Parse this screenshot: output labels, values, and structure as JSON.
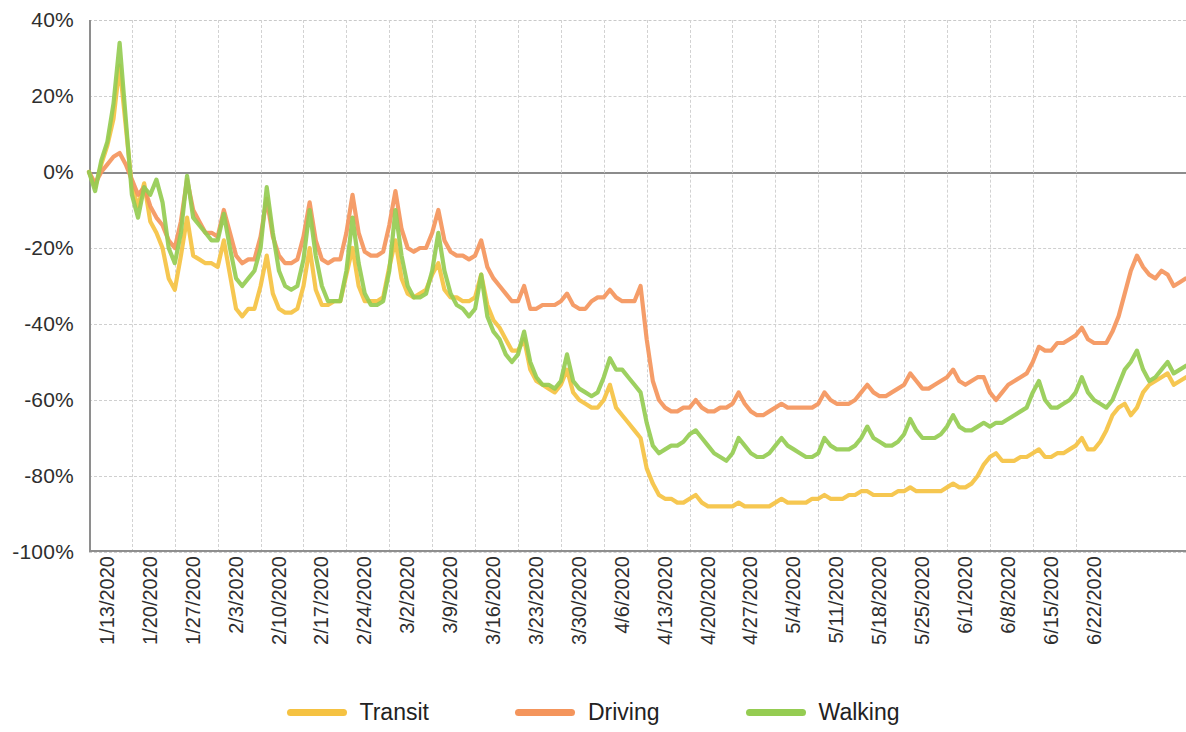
{
  "chart_data": {
    "type": "line",
    "title": "",
    "subtitle": "",
    "xlabel": "",
    "ylabel": "",
    "ylim": [
      -100,
      40
    ],
    "ytick_values": [
      40,
      20,
      0,
      -20,
      -40,
      -60,
      -80,
      -100
    ],
    "ytick_labels": [
      "40%",
      "20%",
      "0%",
      "-20%",
      "-40%",
      "-60%",
      "-80%",
      "-100%"
    ],
    "grid": true,
    "legend_position": "bottom",
    "x_start": "1/13/2020",
    "x_end": "6/25/2020",
    "xtick_labels": [
      "1/13/2020",
      "1/20/2020",
      "1/27/2020",
      "2/3/2020",
      "2/10/2020",
      "2/17/2020",
      "2/24/2020",
      "3/2/2020",
      "3/9/2020",
      "3/16/2020",
      "3/23/2020",
      "3/30/2020",
      "4/6/2020",
      "4/13/2020",
      "4/20/2020",
      "4/27/2020",
      "5/4/2020",
      "5/11/2020",
      "5/18/2020",
      "5/25/2020",
      "6/1/2020",
      "6/8/2020",
      "6/15/2020",
      "6/22/2020"
    ],
    "xtick_interval_days": 7,
    "series": [
      {
        "name": "Transit",
        "color": "#F5C242",
        "values": [
          0,
          -4,
          2,
          7,
          14,
          28,
          12,
          -4,
          -9,
          -3,
          -13,
          -16,
          -20,
          -28,
          -31,
          -22,
          -12,
          -22,
          -23,
          -24,
          -24,
          -25,
          -18,
          -27,
          -36,
          -38,
          -36,
          -36,
          -30,
          -22,
          -32,
          -36,
          -37,
          -37,
          -36,
          -30,
          -20,
          -31,
          -35,
          -35,
          -34,
          -34,
          -27,
          -20,
          -30,
          -34,
          -34,
          -34,
          -33,
          -25,
          -18,
          -28,
          -32,
          -33,
          -32,
          -31,
          -27,
          -24,
          -31,
          -33,
          -33,
          -34,
          -34,
          -33,
          -27,
          -35,
          -39,
          -41,
          -44,
          -47,
          -47,
          -44,
          -52,
          -55,
          -56,
          -57,
          -58,
          -56,
          -52,
          -58,
          -60,
          -61,
          -62,
          -62,
          -60,
          -56,
          -62,
          -64,
          -66,
          -68,
          -70,
          -78,
          -82,
          -85,
          -86,
          -86,
          -87,
          -87,
          -86,
          -85,
          -87,
          -88,
          -88,
          -88,
          -88,
          -88,
          -87,
          -88,
          -88,
          -88,
          -88,
          -88,
          -87,
          -86,
          -87,
          -87,
          -87,
          -87,
          -86,
          -86,
          -85,
          -86,
          -86,
          -86,
          -85,
          -85,
          -84,
          -84,
          -85,
          -85,
          -85,
          -85,
          -84,
          -84,
          -83,
          -84,
          -84,
          -84,
          -84,
          -84,
          -83,
          -82,
          -83,
          -83,
          -82,
          -80,
          -77,
          -75,
          -74,
          -76,
          -76,
          -76,
          -75,
          -75,
          -74,
          -73,
          -75,
          -75,
          -74,
          -74,
          -73,
          -72,
          -70,
          -73,
          -73,
          -71,
          -68,
          -64,
          -62,
          -61,
          -64,
          -62,
          -58,
          -56,
          -55,
          -54,
          -53,
          -56,
          -55,
          -54
        ]
      },
      {
        "name": "Driving",
        "color": "#F4955C",
        "values": [
          0,
          -3,
          0,
          2,
          4,
          5,
          2,
          -2,
          -6,
          -4,
          -9,
          -12,
          -14,
          -18,
          -20,
          -13,
          -2,
          -10,
          -13,
          -16,
          -16,
          -17,
          -10,
          -16,
          -22,
          -24,
          -23,
          -23,
          -17,
          -7,
          -17,
          -22,
          -24,
          -24,
          -23,
          -17,
          -8,
          -18,
          -23,
          -24,
          -23,
          -23,
          -16,
          -6,
          -16,
          -21,
          -22,
          -22,
          -21,
          -14,
          -5,
          -15,
          -20,
          -21,
          -20,
          -20,
          -16,
          -10,
          -18,
          -21,
          -22,
          -22,
          -23,
          -22,
          -18,
          -25,
          -28,
          -30,
          -32,
          -34,
          -34,
          -30,
          -36,
          -36,
          -35,
          -35,
          -35,
          -34,
          -32,
          -35,
          -36,
          -36,
          -34,
          -33,
          -33,
          -31,
          -33,
          -34,
          -34,
          -34,
          -30,
          -44,
          -55,
          -60,
          -62,
          -63,
          -63,
          -62,
          -62,
          -60,
          -62,
          -63,
          -63,
          -62,
          -62,
          -61,
          -58,
          -61,
          -63,
          -64,
          -64,
          -63,
          -62,
          -61,
          -62,
          -62,
          -62,
          -62,
          -62,
          -61,
          -58,
          -60,
          -61,
          -61,
          -61,
          -60,
          -58,
          -56,
          -58,
          -59,
          -59,
          -58,
          -57,
          -56,
          -53,
          -55,
          -57,
          -57,
          -56,
          -55,
          -54,
          -52,
          -55,
          -56,
          -55,
          -54,
          -54,
          -58,
          -60,
          -58,
          -56,
          -55,
          -54,
          -53,
          -50,
          -46,
          -47,
          -47,
          -45,
          -45,
          -44,
          -43,
          -41,
          -44,
          -45,
          -45,
          -45,
          -42,
          -38,
          -32,
          -26,
          -22,
          -25,
          -27,
          -28,
          -26,
          -27,
          -30,
          -29,
          -28
        ]
      },
      {
        "name": "Walking",
        "color": "#95CC52",
        "values": [
          0,
          -5,
          3,
          8,
          18,
          34,
          14,
          -6,
          -12,
          -4,
          -6,
          -2,
          -8,
          -20,
          -24,
          -16,
          -1,
          -12,
          -14,
          -16,
          -18,
          -18,
          -11,
          -20,
          -28,
          -30,
          -28,
          -26,
          -20,
          -4,
          -16,
          -26,
          -30,
          -31,
          -30,
          -23,
          -10,
          -22,
          -30,
          -34,
          -34,
          -34,
          -26,
          -12,
          -24,
          -32,
          -35,
          -35,
          -34,
          -26,
          -10,
          -22,
          -30,
          -33,
          -33,
          -32,
          -26,
          -16,
          -26,
          -32,
          -35,
          -36,
          -38,
          -36,
          -27,
          -38,
          -42,
          -44,
          -48,
          -50,
          -48,
          -42,
          -50,
          -54,
          -56,
          -56,
          -57,
          -55,
          -48,
          -55,
          -57,
          -58,
          -59,
          -58,
          -54,
          -49,
          -52,
          -52,
          -54,
          -56,
          -58,
          -66,
          -72,
          -74,
          -73,
          -72,
          -72,
          -71,
          -69,
          -68,
          -70,
          -72,
          -74,
          -75,
          -76,
          -74,
          -70,
          -72,
          -74,
          -75,
          -75,
          -74,
          -72,
          -70,
          -72,
          -73,
          -74,
          -75,
          -75,
          -74,
          -70,
          -72,
          -73,
          -73,
          -73,
          -72,
          -70,
          -67,
          -70,
          -71,
          -72,
          -72,
          -71,
          -69,
          -65,
          -68,
          -70,
          -70,
          -70,
          -69,
          -67,
          -64,
          -67,
          -68,
          -68,
          -67,
          -66,
          -67,
          -66,
          -66,
          -65,
          -64,
          -63,
          -62,
          -58,
          -55,
          -60,
          -62,
          -62,
          -61,
          -60,
          -58,
          -54,
          -58,
          -60,
          -61,
          -62,
          -60,
          -56,
          -52,
          -50,
          -47,
          -52,
          -55,
          -54,
          -52,
          -50,
          -53,
          -52,
          -51
        ]
      }
    ]
  },
  "legend": {
    "items": [
      {
        "label": "Transit",
        "color": "#F5C242"
      },
      {
        "label": "Driving",
        "color": "#F4955C"
      },
      {
        "label": "Walking",
        "color": "#95CC52"
      }
    ]
  }
}
